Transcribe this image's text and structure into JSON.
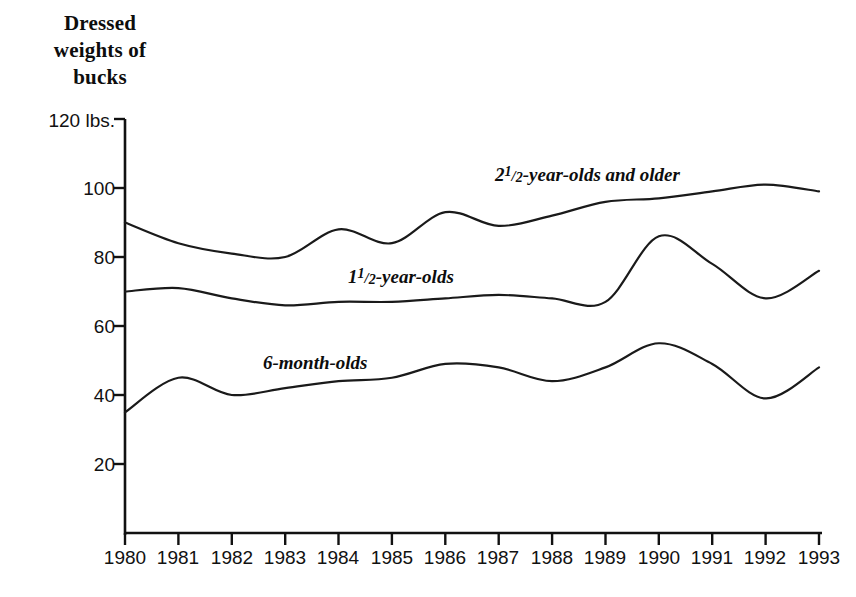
{
  "chart_data": {
    "type": "line",
    "title": "Dressed weights of bucks",
    "title_lines": [
      "Dressed",
      "weights of",
      "bucks"
    ],
    "xlabel": "",
    "ylabel": "",
    "y_unit_label": "120 lbs.",
    "ylim": [
      0,
      120
    ],
    "yticks": [
      120,
      100,
      80,
      60,
      40,
      20
    ],
    "ytick_labels": [
      "120 lbs.",
      "100",
      "80",
      "60",
      "40",
      "20"
    ],
    "grid": false,
    "legend_position": "inline-labels",
    "x": [
      1980,
      1981,
      1982,
      1983,
      1984,
      1985,
      1986,
      1987,
      1988,
      1989,
      1990,
      1991,
      1992,
      1993
    ],
    "categories": [
      "1980",
      "1981",
      "1982",
      "1983",
      "1984",
      "1985",
      "1986",
      "1987",
      "1988",
      "1989",
      "1990",
      "1991",
      "1992",
      "1993"
    ],
    "series": [
      {
        "name": "2½-year-olds and older",
        "name_prefix": "2",
        "name_numerator": "1",
        "name_denominator": "2",
        "name_suffix": "-year-olds and older",
        "color": "#1a1a1a",
        "values": [
          90,
          84,
          81,
          80,
          88,
          84,
          93,
          89,
          92,
          96,
          97,
          99,
          101,
          99
        ]
      },
      {
        "name": "1½-year-olds",
        "name_prefix": "1",
        "name_numerator": "1",
        "name_denominator": "2",
        "name_suffix": "-year-olds",
        "color": "#1a1a1a",
        "values": [
          70,
          71,
          68,
          66,
          67,
          67,
          68,
          69,
          68,
          67,
          86,
          78,
          68,
          76
        ]
      },
      {
        "name": "6-month-olds",
        "name_prefix": "",
        "name_numerator": "",
        "name_denominator": "",
        "name_suffix": "6-month-olds",
        "color": "#1a1a1a",
        "values": [
          35,
          45,
          40,
          42,
          44,
          45,
          49,
          48,
          44,
          48,
          55,
          49,
          39,
          48
        ]
      }
    ]
  },
  "axis": {
    "y_tick_text": {
      "t120": "120 lbs.",
      "t100": "100",
      "t80": "80",
      "t60": "60",
      "t40": "40",
      "t20": "20"
    }
  }
}
